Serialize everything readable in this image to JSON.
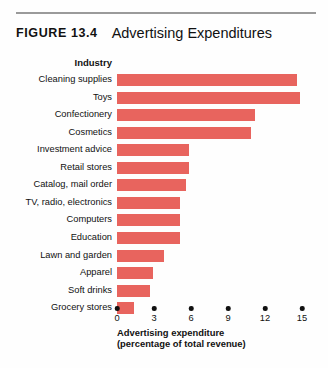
{
  "figure": {
    "number_label": "FIGURE 13.4",
    "title": "Advertising Expenditures"
  },
  "chart_data": {
    "type": "bar",
    "orientation": "horizontal",
    "title": "Advertising Expenditures",
    "xlabel": "Advertising expenditure",
    "xlabel_line2": "(percentage of total revenue)",
    "ylabel": "Industry",
    "xlim": [
      0,
      15
    ],
    "xticks": [
      0,
      3,
      6,
      9,
      12,
      15
    ],
    "xtick_labels": [
      "0",
      "3",
      "6",
      "9",
      "12",
      "15"
    ],
    "grid": false,
    "legend": "none",
    "bar_color": "#e8645e",
    "categories": [
      "Cleaning supplies",
      "Toys",
      "Confectionery",
      "Cosmetics",
      "Investment advice",
      "Retail stores",
      "Catalog, mail order",
      "TV, radio, electronics",
      "Computers",
      "Education",
      "Lawn and garden",
      "Apparel",
      "Soft drinks",
      "Grocery stores"
    ],
    "values": [
      14.6,
      14.8,
      11.2,
      10.9,
      5.8,
      5.8,
      5.6,
      5.1,
      5.1,
      5.1,
      3.8,
      2.9,
      2.7,
      1.4
    ]
  },
  "axis": {
    "title_line1": "Advertising expenditure",
    "title_line2": "(percentage of total revenue)"
  }
}
